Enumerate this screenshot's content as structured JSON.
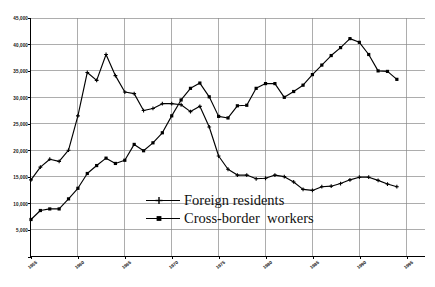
{
  "chart_data": {
    "type": "line",
    "title": "",
    "xlabel": "",
    "ylabel": "",
    "xlim": [
      1955,
      1997
    ],
    "ylim": [
      0,
      45000
    ],
    "grid": true,
    "legend_position": "center",
    "y_ticks": [
      0,
      5000,
      10000,
      15000,
      20000,
      25000,
      30000,
      35000,
      40000,
      45000
    ],
    "y_tick_labels": [
      "",
      "5,000",
      "10,000",
      "15,000",
      "20,000",
      "25,000",
      "30,000",
      "35,000",
      "40,000",
      "45,000"
    ],
    "x_ticks": [
      1955,
      1960,
      1965,
      1970,
      1975,
      1980,
      1985,
      1990,
      1995
    ],
    "x_tick_labels": [
      "1955",
      "1960",
      "1965",
      "1970",
      "1975",
      "1980",
      "1985",
      "1990",
      "1995"
    ],
    "x": [
      1955,
      1956,
      1957,
      1958,
      1959,
      1960,
      1961,
      1962,
      1963,
      1964,
      1965,
      1966,
      1967,
      1968,
      1969,
      1970,
      1971,
      1972,
      1973,
      1974,
      1975,
      1976,
      1977,
      1978,
      1979,
      1980,
      1981,
      1982,
      1983,
      1984,
      1985,
      1986,
      1987,
      1988,
      1989,
      1990,
      1991,
      1992,
      1993,
      1994
    ],
    "series": [
      {
        "name": "Foreign residents",
        "marker": "plus",
        "values": [
          14400,
          16800,
          18300,
          17900,
          20000,
          26500,
          34700,
          33200,
          38100,
          34100,
          31000,
          30700,
          27500,
          27900,
          28800,
          28800,
          28600,
          27300,
          28300,
          24400,
          18900,
          16400,
          15300,
          15300,
          14600,
          14700,
          15300,
          15000,
          14000,
          12600,
          12400,
          13100,
          13200,
          13700,
          14400,
          14900,
          14900,
          14300,
          13600,
          13100
        ]
      },
      {
        "name": "Cross-border  workers",
        "marker": "square",
        "values": [
          6900,
          8600,
          8900,
          8900,
          10800,
          12800,
          15600,
          17100,
          18500,
          17500,
          18100,
          21100,
          19900,
          21400,
          23300,
          26500,
          29500,
          31700,
          32700,
          30100,
          26400,
          26100,
          28400,
          28500,
          31700,
          32600,
          32600,
          30000,
          31100,
          32300,
          34300,
          36100,
          37900,
          39400,
          41100,
          40400,
          38100,
          35000,
          34900,
          33400
        ]
      }
    ]
  },
  "legend": {
    "items": [
      {
        "label": "Foreign residents",
        "marker": "plus"
      },
      {
        "label": "Cross-border  workers",
        "marker": "square"
      }
    ]
  }
}
